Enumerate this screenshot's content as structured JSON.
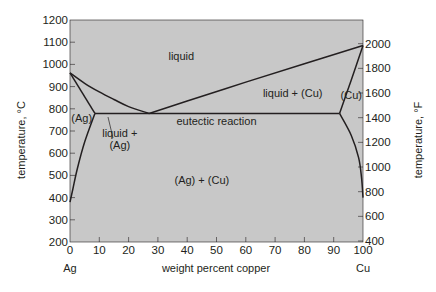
{
  "chart_data": {
    "type": "line",
    "title": "",
    "subtitle": "Copper–silver phase diagram",
    "xlabel": "weight percent copper",
    "ylabel_left": "temperature, °C",
    "ylabel_right": "temperature, °F",
    "xlim": [
      0,
      100
    ],
    "ylim": [
      200,
      1200
    ],
    "ylim_right": [
      400,
      2000
    ],
    "grid": false,
    "legend": "none",
    "background_color": "#c8c8c8",
    "line_color": "#231f20",
    "x_ticks": [
      0,
      10,
      20,
      30,
      40,
      50,
      60,
      70,
      80,
      90,
      100
    ],
    "x_tick_labels": [
      "0",
      "10",
      "20",
      "30",
      "40",
      "50",
      "60",
      "70",
      "80",
      "90",
      "100"
    ],
    "x_end_labels": {
      "left": "Ag",
      "right": "Cu"
    },
    "y_ticks_left": [
      200,
      300,
      400,
      500,
      600,
      700,
      800,
      900,
      1000,
      1100,
      1200
    ],
    "y_tick_labels_left": [
      "200",
      "300",
      "400",
      "500",
      "600",
      "700",
      "800",
      "900",
      "1000",
      "1100",
      "1200"
    ],
    "y_ticks_right_F": [
      400,
      600,
      800,
      1000,
      1200,
      1400,
      1600,
      1800,
      2000
    ],
    "y_tick_labels_right": [
      "400",
      "600",
      "800",
      "1000",
      "1200",
      "1400",
      "1600",
      "1800",
      "2000"
    ],
    "key_points": {
      "ag_melting": {
        "wt_cu": 0,
        "temp_c": 962
      },
      "cu_melting": {
        "wt_cu": 100,
        "temp_c": 1085
      },
      "eutectic": {
        "wt_cu": 27,
        "temp_c": 779
      },
      "ag_max_solubility": {
        "wt_cu": 8.5,
        "temp_c": 779
      },
      "cu_max_solubility": {
        "wt_cu": 92,
        "temp_c": 779
      }
    },
    "series": [
      {
        "name": "liquidus (Ag side)",
        "x": [
          0,
          5,
          10,
          15,
          20,
          27
        ],
        "y": [
          962,
          915,
          876,
          842,
          810,
          779
        ]
      },
      {
        "name": "liquidus (Cu side)",
        "x": [
          27,
          40,
          60,
          80,
          100
        ],
        "y": [
          779,
          835,
          920,
          1003,
          1085
        ]
      },
      {
        "name": "solidus (Ag)",
        "x": [
          0,
          8.5
        ],
        "y": [
          962,
          779
        ]
      },
      {
        "name": "solidus (Cu)",
        "x": [
          92,
          96,
          100
        ],
        "y": [
          779,
          930,
          1085
        ]
      },
      {
        "name": "eutectic isotherm",
        "x": [
          8.5,
          92
        ],
        "y": [
          779,
          779
        ]
      },
      {
        "name": "solvus (Ag)",
        "x": [
          8.5,
          5,
          2.5,
          1,
          0
        ],
        "y": [
          779,
          650,
          530,
          440,
          380
        ]
      },
      {
        "name": "solvus (Cu)",
        "x": [
          92,
          96,
          98.5,
          99.5,
          100
        ],
        "y": [
          779,
          680,
          580,
          490,
          400
        ]
      }
    ],
    "annotations": [
      {
        "text": "liquid",
        "wt_cu": 38,
        "temp_c": 1040
      },
      {
        "text": "liquid + (Cu)",
        "wt_cu": 76,
        "temp_c": 870
      },
      {
        "text": "(Cu)",
        "wt_cu": 96,
        "temp_c": 860
      },
      {
        "text": "(Ag)",
        "wt_cu": 4,
        "temp_c": 760
      },
      {
        "text": "liquid +",
        "wt_cu": 17,
        "temp_c": 690
      },
      {
        "text": "(Ag)",
        "wt_cu": 17,
        "temp_c": 635
      },
      {
        "text": "eutectic reaction",
        "wt_cu": 50,
        "temp_c": 745
      },
      {
        "text": "(Ag) + (Cu)",
        "wt_cu": 45,
        "temp_c": 480
      }
    ]
  }
}
